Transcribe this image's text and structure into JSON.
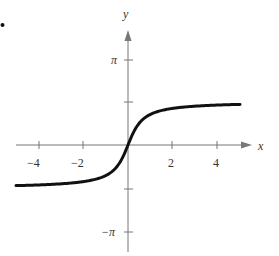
{
  "marker": "•",
  "chart_data": {
    "type": "line",
    "title": "",
    "function": "y = arctan(2x)",
    "xlabel": "x",
    "ylabel": "y",
    "xlim": [
      -5.2,
      5.2
    ],
    "ylim": [
      -3.9,
      3.9
    ],
    "grid": false,
    "legend": null,
    "x_ticks": [
      -4,
      -2,
      2,
      4
    ],
    "x_tick_labels": [
      "−4",
      "−2",
      "2",
      "4"
    ],
    "y_ticks": [
      3.14159,
      1.5708,
      -1.5708,
      -3.14159
    ],
    "y_tick_labels": [
      "π",
      "",
      "",
      "−π"
    ],
    "series": [
      {
        "name": "y = arctan(2x)",
        "x": [
          -5,
          -4,
          -3,
          -2,
          -1.5,
          -1,
          -0.5,
          -0.25,
          0,
          0.25,
          0.5,
          1,
          1.5,
          2,
          3,
          4,
          5
        ],
        "y": [
          -1.471,
          -1.446,
          -1.406,
          -1.326,
          -1.249,
          -1.107,
          -0.785,
          -0.464,
          0,
          0.464,
          0.785,
          1.107,
          1.249,
          1.326,
          1.406,
          1.446,
          1.471
        ]
      }
    ],
    "horizontal_asymptotes": [
      "y = π/2",
      "y = −π/2"
    ]
  },
  "labels": {
    "x_axis": "x",
    "y_axis": "y",
    "pi": "π",
    "neg_pi": "−π",
    "xt_m4": "−4",
    "xt_m2": "−2",
    "xt_2": "2",
    "xt_4": "4"
  }
}
